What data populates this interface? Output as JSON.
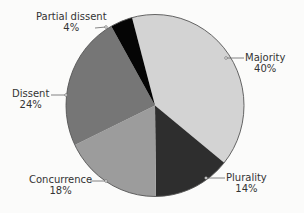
{
  "chart_data": {
    "type": "pie",
    "title": "",
    "start_angle_deg": -15,
    "direction": "clockwise",
    "slices": [
      {
        "label": "Majority",
        "value": 40,
        "display": "40%",
        "color": "#d3d3d3"
      },
      {
        "label": "Plurality",
        "value": 14,
        "display": "14%",
        "color": "#2e2e2e"
      },
      {
        "label": "Concurrence",
        "value": 18,
        "display": "18%",
        "color": "#9c9c9c"
      },
      {
        "label": "Dissent",
        "value": 24,
        "display": "24%",
        "color": "#767676"
      },
      {
        "label": "Partial dissent",
        "value": 4,
        "display": "4%",
        "color": "#050505"
      }
    ],
    "legend": "none (callout labels)",
    "outline_color": "#555555"
  },
  "labels": {
    "majority": {
      "name": "Majority",
      "pct": "40%"
    },
    "plurality": {
      "name": "Plurality",
      "pct": "14%"
    },
    "concurrence": {
      "name": "Concurrence",
      "pct": "18%"
    },
    "dissent": {
      "name": "Dissent",
      "pct": "24%"
    },
    "partial_dissent": {
      "name": "Partial dissent",
      "pct": "4%"
    }
  }
}
